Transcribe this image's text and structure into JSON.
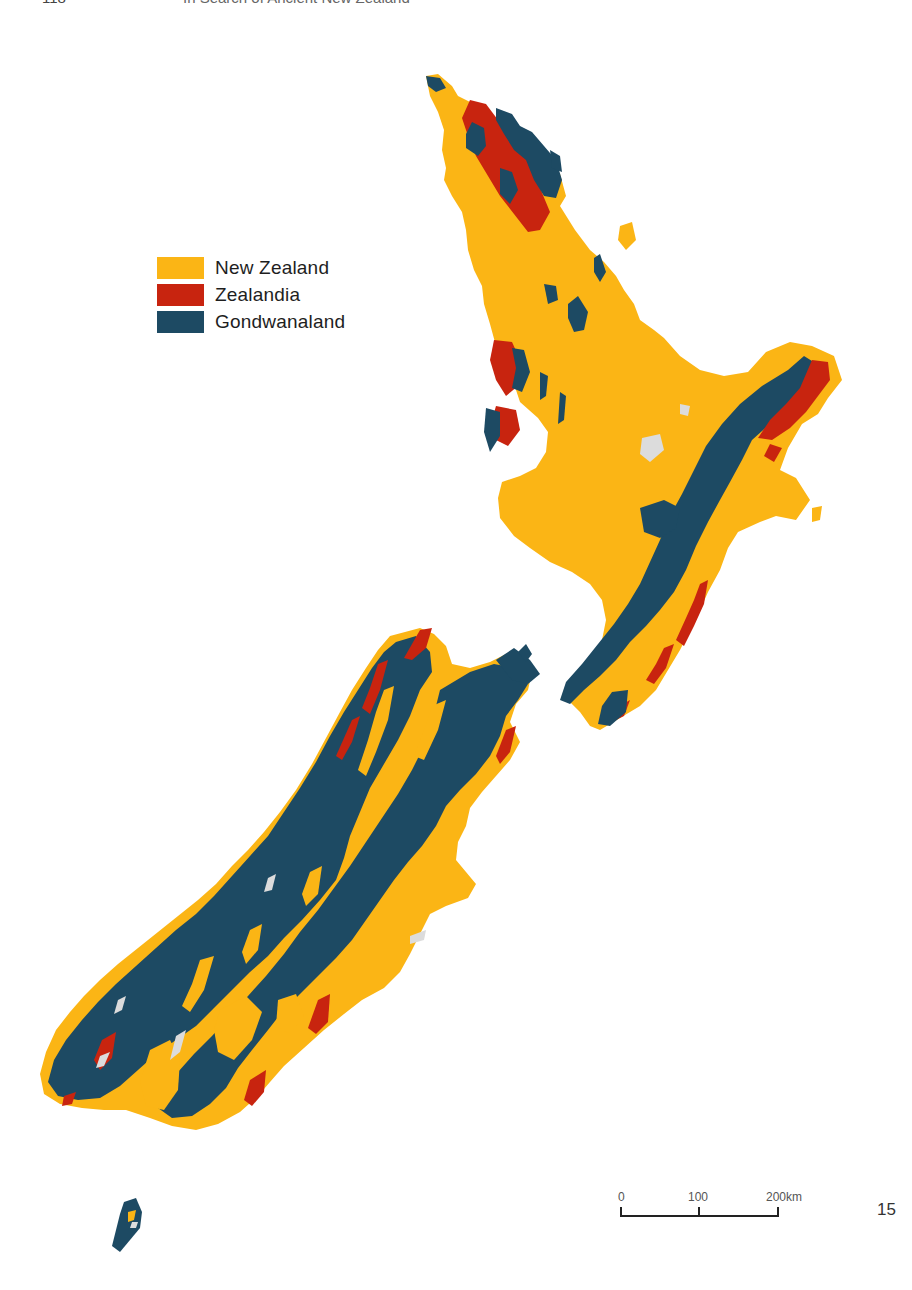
{
  "running_header": {
    "folio": "118",
    "title": "In Search of Ancient New Zealand"
  },
  "colors": {
    "new_zealand": "#fbb515",
    "zealandia": "#c8240f",
    "gondwanaland": "#1d4a63",
    "lakes": "#dcdcdc",
    "background": "#ffffff"
  },
  "legend": {
    "items": [
      {
        "label": "New Zealand",
        "color": "#fbb515"
      },
      {
        "label": "Zealandia",
        "color": "#c8240f"
      },
      {
        "label": "Gondwanaland",
        "color": "#1d4a63"
      }
    ]
  },
  "map": {
    "subject": "Geological origin of New Zealand rocks",
    "regions": [
      "North Island",
      "South Island",
      "Stewart Island"
    ]
  },
  "scale_bar": {
    "labels": [
      "0",
      "100",
      "200km"
    ]
  },
  "page_number": "15"
}
